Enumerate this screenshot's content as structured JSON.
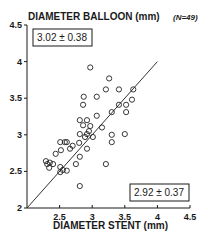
{
  "chart_data": {
    "type": "scatter",
    "title": "DIAMETER BALLOON (mm)",
    "ylabel": "DIAMETER BALLOON (mm)",
    "xlabel": "DIAMETER STENT (mm)",
    "n_label": "(N=49)",
    "xlim": [
      2,
      4.5
    ],
    "ylim": [
      2,
      4.5
    ],
    "x_ticks": [
      2,
      2.5,
      3,
      3.5,
      4,
      4.5
    ],
    "y_ticks": [
      2,
      2.5,
      3,
      3.5,
      4,
      4.5
    ],
    "x_tick_labels": [
      "2.5",
      "3",
      "3.5",
      "4",
      "4.5"
    ],
    "y_tick_labels": [
      "2",
      "2.5",
      "3",
      "3.5",
      "4",
      "4.5"
    ],
    "grid": false,
    "annotations": {
      "balloon_mean_sd": "3.02 ± 0.38",
      "stent_mean_sd": "2.92 ± 0.37"
    },
    "reference_line": {
      "label": "identity",
      "from": [
        2,
        2
      ],
      "to": [
        4,
        4
      ]
    },
    "series": [
      {
        "name": "stent vs balloon",
        "marker": "open-circle",
        "points": [
          [
            2.97,
            3.92
          ],
          [
            3.26,
            3.77
          ],
          [
            3.21,
            3.62
          ],
          [
            3.41,
            3.62
          ],
          [
            3.63,
            3.62
          ],
          [
            2.87,
            3.52
          ],
          [
            3.07,
            3.52
          ],
          [
            3.61,
            3.48
          ],
          [
            3.52,
            3.41
          ],
          [
            3.41,
            3.41
          ],
          [
            2.86,
            3.41
          ],
          [
            3.52,
            3.31
          ],
          [
            3.3,
            3.31
          ],
          [
            3.07,
            3.26
          ],
          [
            2.81,
            3.2
          ],
          [
            2.92,
            3.2
          ],
          [
            2.86,
            3.13
          ],
          [
            2.97,
            3.12
          ],
          [
            2.81,
            3.01
          ],
          [
            2.92,
            3.01
          ],
          [
            2.89,
            2.97
          ],
          [
            3.01,
            2.97
          ],
          [
            3.3,
            3.0
          ],
          [
            3.5,
            3.01
          ],
          [
            2.8,
            2.89
          ],
          [
            2.51,
            2.9
          ],
          [
            2.58,
            2.9
          ],
          [
            2.61,
            2.9
          ],
          [
            3.3,
            2.9
          ],
          [
            2.52,
            2.79
          ],
          [
            2.66,
            2.81
          ],
          [
            2.92,
            2.81
          ],
          [
            2.44,
            2.74
          ],
          [
            2.81,
            2.7
          ],
          [
            2.29,
            2.64
          ],
          [
            2.31,
            2.6
          ],
          [
            2.4,
            2.6
          ],
          [
            2.34,
            2.55
          ],
          [
            2.51,
            2.56
          ],
          [
            2.51,
            2.49
          ],
          [
            2.61,
            2.51
          ],
          [
            2.75,
            2.6
          ],
          [
            3.21,
            2.6
          ],
          [
            2.81,
            2.3
          ],
          [
            2.55,
            2.52
          ],
          [
            2.7,
            2.85
          ],
          [
            2.95,
            3.05
          ],
          [
            3.15,
            3.1
          ],
          [
            2.35,
            2.62
          ]
        ]
      }
    ]
  }
}
